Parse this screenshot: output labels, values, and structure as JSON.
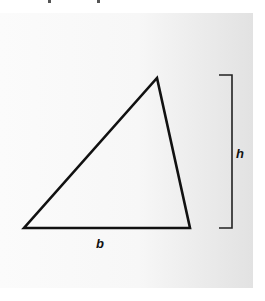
{
  "diagram": {
    "type": "triangle-area-figure",
    "shape": "triangle",
    "vertices": [
      [
        24,
        228
      ],
      [
        190,
        228
      ],
      [
        157,
        78
      ]
    ],
    "base_label": "b",
    "height_label": "h",
    "height_bracket": {
      "x": 232,
      "top": 75,
      "bottom": 228
    },
    "stroke_color": "#111111"
  }
}
